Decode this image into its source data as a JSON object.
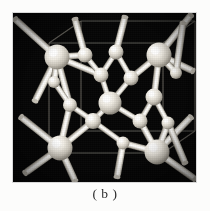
{
  "figure": {
    "caption": "( b )",
    "panel_label": "b",
    "background_color": "#fcfcfb",
    "panel_background_color": "#050505",
    "atom_color": "#f2efe8",
    "bond_color": "#e6e2da",
    "cell_edge_color": "#6d6a63",
    "panel": {
      "x": 13,
      "y": 13,
      "width": 183,
      "height": 169
    }
  },
  "structure": {
    "name": "diamond-cubic-lattice",
    "description": "ball-and-stick model of a diamond / zincblende cubic unit cell",
    "cell_edges": [
      {
        "x1": 36,
        "y1": 30,
        "x2": 150,
        "y2": 30
      },
      {
        "x1": 36,
        "y1": 30,
        "x2": 36,
        "y2": 140
      },
      {
        "x1": 150,
        "y1": 30,
        "x2": 150,
        "y2": 140
      },
      {
        "x1": 36,
        "y1": 140,
        "x2": 150,
        "y2": 140
      },
      {
        "x1": 36,
        "y1": 30,
        "x2": 68,
        "y2": 8
      },
      {
        "x1": 150,
        "y1": 30,
        "x2": 182,
        "y2": 8
      },
      {
        "x1": 36,
        "y1": 140,
        "x2": 68,
        "y2": 118
      },
      {
        "x1": 150,
        "y1": 140,
        "x2": 182,
        "y2": 118
      },
      {
        "x1": 68,
        "y1": 8,
        "x2": 182,
        "y2": 8
      },
      {
        "x1": 68,
        "y1": 8,
        "x2": 68,
        "y2": 118
      },
      {
        "x1": 182,
        "y1": 8,
        "x2": 182,
        "y2": 118
      },
      {
        "x1": 68,
        "y1": 118,
        "x2": 182,
        "y2": 118
      }
    ],
    "atoms": [
      {
        "id": "a1",
        "cx": 44,
        "cy": 44,
        "r": 12.5,
        "kind": "corner"
      },
      {
        "id": "a2",
        "cx": 146,
        "cy": 42,
        "r": 12.5,
        "kind": "corner"
      },
      {
        "id": "a3",
        "cx": 47,
        "cy": 135,
        "r": 12.5,
        "kind": "corner"
      },
      {
        "id": "a4",
        "cx": 144,
        "cy": 139,
        "r": 12.5,
        "kind": "corner"
      },
      {
        "id": "a5",
        "cx": 97,
        "cy": 90,
        "r": 11.5,
        "kind": "center"
      },
      {
        "id": "a6",
        "cx": 72,
        "cy": 42,
        "r": 7.5,
        "kind": "inner"
      },
      {
        "id": "a7",
        "cx": 103,
        "cy": 39,
        "r": 7.5,
        "kind": "inner"
      },
      {
        "id": "a8",
        "cx": 88,
        "cy": 62,
        "r": 7.5,
        "kind": "inner"
      },
      {
        "id": "a9",
        "cx": 118,
        "cy": 65,
        "r": 7.5,
        "kind": "inner"
      },
      {
        "id": "a10",
        "cx": 141,
        "cy": 84,
        "r": 8.5,
        "kind": "inner"
      },
      {
        "id": "a11",
        "cx": 127,
        "cy": 108,
        "r": 7.5,
        "kind": "inner"
      },
      {
        "id": "a12",
        "cx": 80,
        "cy": 108,
        "r": 8.0,
        "kind": "inner"
      },
      {
        "id": "a13",
        "cx": 57,
        "cy": 92,
        "r": 7.0,
        "kind": "inner"
      },
      {
        "id": "a14",
        "cx": 155,
        "cy": 110,
        "r": 6.5,
        "kind": "inner"
      },
      {
        "id": "a15",
        "cx": 41,
        "cy": 69,
        "r": 6.0,
        "kind": "inner"
      },
      {
        "id": "a16",
        "cx": 110,
        "cy": 130,
        "r": 6.5,
        "kind": "inner"
      },
      {
        "id": "a17",
        "cx": 163,
        "cy": 60,
        "r": 6.0,
        "kind": "inner"
      }
    ],
    "bonds": [
      {
        "from": "a1",
        "to": "a6"
      },
      {
        "from": "a1",
        "to": "a8"
      },
      {
        "from": "a1",
        "to": "a15"
      },
      {
        "from": "a6",
        "to": "a8"
      },
      {
        "from": "a7",
        "to": "a8"
      },
      {
        "from": "a7",
        "to": "a9"
      },
      {
        "from": "a2",
        "to": "a9"
      },
      {
        "from": "a2",
        "to": "a10"
      },
      {
        "from": "a2",
        "to": "a17"
      },
      {
        "from": "a9",
        "to": "a5"
      },
      {
        "from": "a8",
        "to": "a5"
      },
      {
        "from": "a5",
        "to": "a12"
      },
      {
        "from": "a5",
        "to": "a11"
      },
      {
        "from": "a10",
        "to": "a11"
      },
      {
        "from": "a10",
        "to": "a14"
      },
      {
        "from": "a11",
        "to": "a4"
      },
      {
        "from": "a12",
        "to": "a3"
      },
      {
        "from": "a12",
        "to": "a16"
      },
      {
        "from": "a13",
        "to": "a12"
      },
      {
        "from": "a13",
        "to": "a1"
      },
      {
        "from": "a15",
        "to": "a13"
      },
      {
        "from": "a16",
        "to": "a4"
      },
      {
        "from": "a14",
        "to": "a4"
      },
      {
        "from": "a3",
        "to": "a13"
      }
    ],
    "outer_bonds": [
      {
        "from": "a1",
        "x2": 2,
        "y2": 6
      },
      {
        "from": "a1",
        "x2": 22,
        "y2": 88
      },
      {
        "from": "a2",
        "x2": 178,
        "y2": 2
      },
      {
        "from": "a2",
        "x2": 180,
        "y2": 58
      },
      {
        "from": "a3",
        "x2": 8,
        "y2": 104
      },
      {
        "from": "a3",
        "x2": 62,
        "y2": 168
      },
      {
        "from": "a3",
        "x2": 12,
        "y2": 160
      },
      {
        "from": "a4",
        "x2": 182,
        "y2": 166
      },
      {
        "from": "a4",
        "x2": 178,
        "y2": 104
      },
      {
        "from": "a6",
        "x2": 62,
        "y2": 6
      },
      {
        "from": "a7",
        "x2": 112,
        "y2": 4
      },
      {
        "from": "a17",
        "x2": 170,
        "y2": 10
      },
      {
        "from": "a16",
        "x2": 104,
        "y2": 164
      },
      {
        "from": "a14",
        "x2": 172,
        "y2": 150
      }
    ]
  }
}
